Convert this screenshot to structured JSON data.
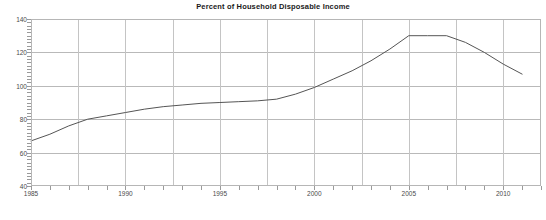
{
  "chart_data": {
    "type": "line",
    "title": "Percent of Household Disposable Income",
    "xlabel": "",
    "ylabel": "",
    "xlim": [
      1985,
      2012
    ],
    "ylim": [
      40,
      140
    ],
    "ytick_labels": [
      "40",
      "60",
      "80",
      "100",
      "120",
      "140"
    ],
    "yticks": [
      40,
      60,
      80,
      100,
      120,
      140
    ],
    "xtick_labels": [
      "1985",
      "1990",
      "1995",
      "2000",
      "2005",
      "2010"
    ],
    "xticks": [
      1985,
      1990,
      1995,
      2000,
      2005,
      2010
    ],
    "gridlines_major_x": [
      1985,
      1987.5,
      1990,
      1992.5,
      1995,
      1997.5,
      2000,
      2002.5,
      2005,
      2007.5,
      2010
    ],
    "grid": true,
    "legend": "none",
    "line_color": "#555555",
    "grid_color": "#b9b9b9",
    "axis_color": "#b6b6b6",
    "background": "#ffffff",
    "series": [
      {
        "name": "Household Debt",
        "x": [
          1985,
          1986,
          1987,
          1988,
          1989,
          1990,
          1991,
          1992,
          1993,
          1994,
          1995,
          1996,
          1997,
          1998,
          1999,
          2000,
          2001,
          2002,
          2003,
          2004,
          2005,
          2006,
          2007,
          2008,
          2009,
          2010,
          2011
        ],
        "values": [
          67,
          71,
          76,
          80,
          82,
          84,
          86,
          87.5,
          88.5,
          89.5,
          90,
          90.5,
          91,
          92,
          95,
          99,
          104,
          109,
          115,
          122,
          130,
          130,
          130,
          126,
          120,
          113,
          107
        ]
      }
    ]
  }
}
